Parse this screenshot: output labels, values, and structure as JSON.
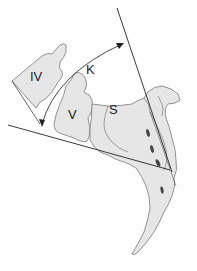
{
  "figure": {
    "labels": {
      "vertebra_iv": "IV",
      "vertebra_v": "V",
      "sacrum": "S",
      "angle": "K"
    },
    "colors": {
      "bone_fill": "#e6e6e6",
      "bone_stroke": "#7a7a7a",
      "line": "#222222",
      "foramen": "#444444",
      "background": "#ffffff"
    }
  }
}
